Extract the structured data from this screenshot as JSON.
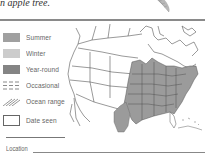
{
  "caption": {
    "text": "n apple tree."
  },
  "legend": {
    "items": [
      {
        "label": "Summer",
        "type": "fill",
        "color": "#a0a0a0"
      },
      {
        "label": "Winter",
        "type": "fill",
        "color": "#cccccc"
      },
      {
        "label": "Year-round",
        "type": "fill",
        "color": "#848484"
      },
      {
        "label": "Occasional",
        "type": "dashed-pattern",
        "color": "#8a8a8a"
      },
      {
        "label": "Ocean range",
        "type": "hatch-pattern",
        "color": "#8a8a8a"
      },
      {
        "label": "Date seen",
        "type": "empty-box",
        "color": "#666666"
      }
    ]
  },
  "map": {
    "subject": "North America range map",
    "range_color": "#9b9b9b",
    "outline_color": "#444444"
  },
  "form": {
    "location_label": "Location"
  }
}
